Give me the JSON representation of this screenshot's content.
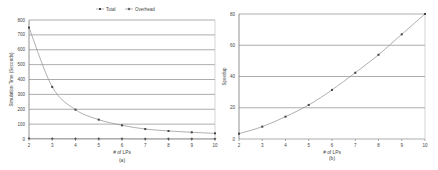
{
  "chart_data": [
    {
      "id": "a",
      "type": "line",
      "caption": "(a)",
      "title": "",
      "xlabel": "# of LPs",
      "ylabel": "Simulation Time (Seconds)",
      "x": [
        2,
        3,
        4,
        5,
        6,
        7,
        8,
        9,
        10
      ],
      "xticks": [
        "2",
        "3",
        "4",
        "5",
        "6",
        "7",
        "8",
        "9",
        "10"
      ],
      "yticks": [
        "0",
        "100",
        "200",
        "300",
        "400",
        "500",
        "600",
        "700",
        "800"
      ],
      "ylim": [
        0,
        800
      ],
      "grid": true,
      "legend_position": "top",
      "series": [
        {
          "name": "Total",
          "marker": "square",
          "color": "#9a9a9a",
          "values": [
            749,
            350,
            197,
            130,
            92,
            67,
            54,
            45,
            38
          ]
        },
        {
          "name": "Overhead",
          "marker": "diamond",
          "color": "#9a9a9a",
          "values": [
            4,
            3,
            2,
            2,
            2,
            1,
            1,
            1,
            1
          ]
        }
      ]
    },
    {
      "id": "b",
      "type": "line",
      "caption": "(b)",
      "title": "",
      "xlabel": "# of LPs",
      "ylabel": "Speedup",
      "x": [
        2,
        3,
        4,
        5,
        6,
        7,
        8,
        9,
        10
      ],
      "xticks": [
        "2",
        "3",
        "4",
        "5",
        "6",
        "7",
        "8",
        "9",
        "10"
      ],
      "yticks": [
        "0",
        "20",
        "40",
        "60",
        "80"
      ],
      "ylim": [
        0,
        80
      ],
      "grid": true,
      "series": [
        {
          "name": "Speedup",
          "marker": "square",
          "color": "#9a9a9a",
          "values": [
            3.4,
            7.9,
            14.3,
            21.8,
            31.4,
            42.4,
            53.9,
            67,
            80
          ]
        }
      ]
    }
  ]
}
